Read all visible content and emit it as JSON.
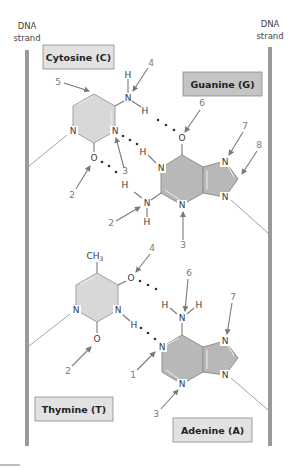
{
  "strands": {
    "left_label": [
      "DNA",
      "strand"
    ],
    "right_label": [
      "DNA",
      "strand"
    ]
  },
  "bases": {
    "cytosine": {
      "label": "Cytosine (C)",
      "atoms": {
        "n1": "N",
        "n3": "N",
        "o2": "O",
        "n4": "N",
        "h4a": "H",
        "h4b": "H"
      },
      "arrows": {
        "a5": "5",
        "a4": "4",
        "a3": "3",
        "a2": "2"
      }
    },
    "guanine": {
      "label": "Guanine (G)",
      "atoms": {
        "o6": "O",
        "n1": "N",
        "h1": "H",
        "n2": "N",
        "h2a": "H",
        "h2b": "H",
        "n3": "N",
        "n7": "N",
        "n9": "N"
      },
      "arrows": {
        "a6": "6",
        "a7": "7",
        "a8": "8",
        "a2": "2",
        "a3": "3",
        "a4": "4"
      }
    },
    "thymine": {
      "label": "Thymine (T)",
      "atoms": {
        "ch3": "CH",
        "ch3_sub": "3",
        "o4": "O",
        "n3": "N",
        "h3": "H",
        "n1": "N",
        "o2": "O"
      },
      "arrows": {
        "a4": "4",
        "a2": "2"
      }
    },
    "adenine": {
      "label": "Adenine (A)",
      "atoms": {
        "n6": "N",
        "h6a": "H",
        "h6b": "H",
        "n1": "N",
        "n3": "N",
        "n7": "N",
        "n9": "N"
      },
      "arrows": {
        "a6": "6",
        "a7": "7",
        "a1": "1",
        "a3": "3"
      }
    }
  },
  "colors": {
    "purine_fill": "#b8b8b8",
    "pyrimidine_fill": "#d8d8d8",
    "strand": "#9a9a9a",
    "arrow": "#7a7a7a"
  }
}
